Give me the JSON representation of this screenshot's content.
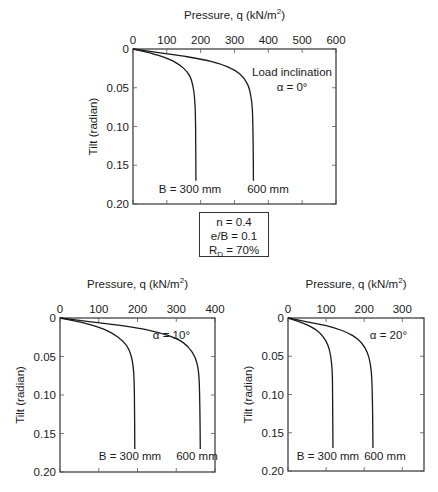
{
  "chart_data": [
    {
      "type": "line",
      "title": "Load inclination α = 0°",
      "annotation": [
        "Load inclination",
        "α = 0°"
      ],
      "xlabel": "Pressure, q (kN/m²)",
      "ylabel": "Tilt (radian)",
      "xlim": [
        0,
        600
      ],
      "ylim": [
        0,
        0.2
      ],
      "y_inverted": true,
      "x_axis_position": "top",
      "xticks": [
        0,
        100,
        200,
        300,
        400,
        500,
        600
      ],
      "yticks": [
        "0",
        "0.05",
        "0.10",
        "0.15",
        "0.20"
      ],
      "grid": false,
      "legend": "inline labels at curve ends",
      "series": [
        {
          "name": "B = 300 mm",
          "points": [
            [
              0,
              0
            ],
            [
              40,
              0.004
            ],
            [
              80,
              0.009
            ],
            [
              120,
              0.016
            ],
            [
              150,
              0.025
            ],
            [
              168,
              0.035
            ],
            [
              178,
              0.05
            ],
            [
              183,
              0.07
            ],
            [
              185,
              0.1
            ],
            [
              186,
              0.17
            ]
          ]
        },
        {
          "name": "600 mm",
          "points": [
            [
              0,
              0
            ],
            [
              80,
              0.005
            ],
            [
              160,
              0.01
            ],
            [
              230,
              0.016
            ],
            [
              280,
              0.023
            ],
            [
              315,
              0.032
            ],
            [
              338,
              0.045
            ],
            [
              348,
              0.06
            ],
            [
              353,
              0.08
            ],
            [
              355,
              0.12
            ],
            [
              356,
              0.17
            ]
          ]
        }
      ]
    },
    {
      "type": "line",
      "annotation": [
        "α = 10°"
      ],
      "xlabel": "Pressure, q (kN/m²)",
      "ylabel": "Tilt (radian)",
      "xlim": [
        0,
        400
      ],
      "ylim": [
        0,
        0.2
      ],
      "y_inverted": true,
      "x_axis_position": "top",
      "xticks": [
        0,
        100,
        200,
        300,
        400
      ],
      "yticks": [
        "0",
        "0.05",
        "0.10",
        "0.15",
        "0.20"
      ],
      "grid": false,
      "series": [
        {
          "name": "B = 300 mm",
          "points": [
            [
              0,
              0
            ],
            [
              40,
              0.004
            ],
            [
              80,
              0.009
            ],
            [
              120,
              0.016
            ],
            [
              150,
              0.025
            ],
            [
              172,
              0.036
            ],
            [
              184,
              0.05
            ],
            [
              190,
              0.07
            ],
            [
              192,
              0.1
            ],
            [
              193,
              0.17
            ]
          ]
        },
        {
          "name": "600 mm",
          "points": [
            [
              0,
              0
            ],
            [
              80,
              0.005
            ],
            [
              160,
              0.01
            ],
            [
              230,
              0.016
            ],
            [
              280,
              0.023
            ],
            [
              318,
              0.032
            ],
            [
              342,
              0.045
            ],
            [
              354,
              0.06
            ],
            [
              359,
              0.08
            ],
            [
              361,
              0.12
            ],
            [
              362,
              0.17
            ]
          ]
        }
      ]
    },
    {
      "type": "line",
      "annotation": [
        "α = 20°"
      ],
      "xlabel": "Pressure, q (kN/m²)",
      "ylabel": "Tilt (radian)",
      "xlim": [
        0,
        357
      ],
      "ylim": [
        0,
        0.2
      ],
      "y_inverted": true,
      "x_axis_position": "top",
      "xticks": [
        0,
        100,
        200,
        300
      ],
      "yticks": [
        "0",
        "0.05",
        "0.10",
        "0.15",
        "0.20"
      ],
      "grid": false,
      "series": [
        {
          "name": "B = 300 mm",
          "points": [
            [
              0,
              0
            ],
            [
              25,
              0.004
            ],
            [
              50,
              0.009
            ],
            [
              75,
              0.016
            ],
            [
              93,
              0.025
            ],
            [
              105,
              0.036
            ],
            [
              112,
              0.05
            ],
            [
              116,
              0.07
            ],
            [
              117,
              0.1
            ],
            [
              118,
              0.17
            ]
          ]
        },
        {
          "name": "600 mm",
          "points": [
            [
              0,
              0
            ],
            [
              50,
              0.005
            ],
            [
              100,
              0.01
            ],
            [
              140,
              0.016
            ],
            [
              170,
              0.023
            ],
            [
              192,
              0.032
            ],
            [
              208,
              0.045
            ],
            [
              216,
              0.06
            ],
            [
              220,
              0.08
            ],
            [
              222,
              0.12
            ],
            [
              223,
              0.17
            ]
          ]
        }
      ]
    }
  ],
  "info_box": {
    "line1": "n = 0.4",
    "line2": "e/B = 0.1",
    "line3_prefix": "R",
    "line3_sub": "D",
    "line3_suffix": " = 70%"
  },
  "layout_px": [
    {
      "left": 133,
      "top": 49,
      "right": 336,
      "bottom": 204,
      "ann_x": 292,
      "ann_y": 76,
      "lab300_x": 190,
      "lab600_x": 268,
      "lab_y": 193,
      "title_y": 19
    },
    {
      "left": 60,
      "top": 318,
      "right": 215,
      "bottom": 472,
      "ann_x": 190,
      "ann_y": 339,
      "lab300_x": 130,
      "lab600_x": 197,
      "lab_y": 460,
      "title_y": 288
    },
    {
      "left": 288,
      "top": 318,
      "right": 424,
      "bottom": 471,
      "ann_x": 407,
      "ann_y": 339,
      "lab300_x": 328,
      "lab600_x": 385,
      "lab_y": 460,
      "title_y": 288
    }
  ]
}
